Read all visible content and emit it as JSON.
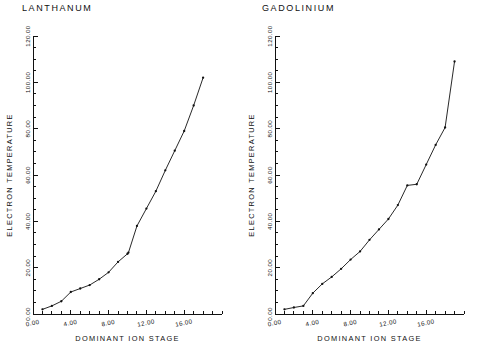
{
  "figure": {
    "background": "#ffffff",
    "ink": "#111111",
    "panel_count": 2
  },
  "chart_data": [
    {
      "type": "line",
      "title": "LANTHANUM",
      "xlabel": "DOMINANT ION STAGE",
      "ylabel": "ELECTRON TEMPERATURE",
      "xlim": [
        0.0,
        20.0
      ],
      "ylim": [
        0.0,
        120.0
      ],
      "xticks": [
        0.0,
        4.0,
        8.0,
        12.0,
        16.0
      ],
      "xtick_labels": [
        "0.00",
        "4.00",
        "8.00",
        "12.00",
        "16.00"
      ],
      "yticks": [
        0.0,
        20.0,
        40.0,
        60.0,
        80.0,
        100.0,
        120.0
      ],
      "ytick_labels": [
        "0.00",
        "20.00",
        "40.00",
        "60.00",
        "80.00",
        "100.00",
        "120.00"
      ],
      "xminor_step": 1.0,
      "yminor_step": 5.0,
      "grid": false,
      "legend": false,
      "markers": true,
      "x": [
        1.0,
        2.0,
        3.0,
        4.0,
        5.0,
        6.0,
        7.0,
        8.0,
        9.0,
        10.0,
        10.1,
        11.0,
        12.0,
        13.0,
        14.0,
        15.0,
        16.0,
        17.0,
        18.0
      ],
      "values": [
        2.0,
        3.5,
        5.5,
        9.5,
        11.0,
        12.5,
        15.0,
        18.0,
        22.5,
        26.0,
        26.5,
        38.0,
        45.5,
        53.0,
        62.0,
        70.5,
        79.0,
        90.0,
        102.0
      ]
    },
    {
      "type": "line",
      "title": "GADOLINIUM",
      "xlabel": "DOMINANT ION STAGE",
      "ylabel": "ELECTRON TEMPERATURE",
      "xlim": [
        0.0,
        20.0
      ],
      "ylim": [
        0.0,
        120.0
      ],
      "xticks": [
        0.0,
        4.0,
        8.0,
        12.0,
        16.0
      ],
      "xtick_labels": [
        "0.00",
        "4.00",
        "8.00",
        "12.00",
        "16.00"
      ],
      "yticks": [
        0.0,
        20.0,
        40.0,
        60.0,
        80.0,
        100.0,
        120.0
      ],
      "ytick_labels": [
        "0.00",
        "20.00",
        "40.00",
        "60.00",
        "80.00",
        "100.00",
        "120.00"
      ],
      "xminor_step": 1.0,
      "yminor_step": 5.0,
      "grid": false,
      "legend": false,
      "markers": true,
      "x": [
        1.0,
        2.0,
        3.0,
        4.0,
        5.0,
        6.0,
        7.0,
        8.0,
        9.0,
        10.0,
        11.0,
        12.0,
        13.0,
        14.0,
        15.0,
        16.0,
        17.0,
        18.0,
        19.0
      ],
      "values": [
        2.0,
        2.8,
        3.5,
        9.0,
        13.0,
        16.0,
        19.5,
        23.5,
        27.0,
        32.0,
        36.5,
        41.0,
        47.0,
        55.5,
        56.0,
        64.5,
        73.0,
        80.5,
        109.0
      ]
    }
  ]
}
